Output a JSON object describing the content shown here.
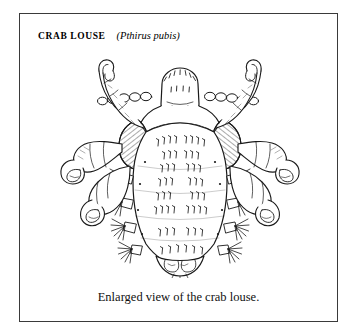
{
  "figure": {
    "title": {
      "common_name": "CRAB LOUSE",
      "scientific_name": "(Pthirus pubis)"
    },
    "caption": "Enlarged view of the crab louse.",
    "illustration": {
      "subject": "crab-louse",
      "style": "pen-and-ink line engraving",
      "view": "dorsal",
      "ink_color": "#1a1a1a",
      "fill_color": "#ffffff",
      "border_color": "#3a3a3a",
      "parts": [
        "head",
        "antenna-left",
        "antenna-right",
        "thorax",
        "abdomen",
        "foreleg-left",
        "foreleg-right",
        "midleg-left",
        "midleg-right",
        "hindleg-left",
        "hindleg-right",
        "claw-left",
        "claw-right",
        "abdominal-setae",
        "lateral-tubercles",
        "terminal-lobes"
      ]
    }
  }
}
